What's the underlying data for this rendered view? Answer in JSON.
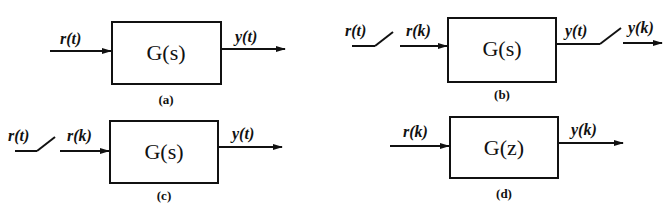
{
  "diagram": {
    "panels": [
      {
        "id": "a",
        "caption": "(a)",
        "block": {
          "func": "G",
          "var": "s"
        },
        "input_signals": [
          "r(t)"
        ],
        "output_signals": [
          "y(t)"
        ],
        "samplers": []
      },
      {
        "id": "b",
        "caption": "(b)",
        "block": {
          "func": "G",
          "var": "s"
        },
        "input_signals": [
          "r(t)",
          "r(k)"
        ],
        "output_signals": [
          "y(t)",
          "y(k)"
        ],
        "samplers": [
          "input-sampler",
          "output-sampler"
        ]
      },
      {
        "id": "c",
        "caption": "(c)",
        "block": {
          "func": "G",
          "var": "s"
        },
        "input_signals": [
          "r(t)",
          "r(k)"
        ],
        "output_signals": [
          "y(t)"
        ],
        "samplers": [
          "input-sampler"
        ]
      },
      {
        "id": "d",
        "caption": "(d)",
        "block": {
          "func": "G",
          "var": "z"
        },
        "input_signals": [
          "r(k)"
        ],
        "output_signals": [
          "y(k)"
        ],
        "samplers": []
      }
    ]
  },
  "labels": {
    "a": {
      "in": "r(t)",
      "out": "y(t)",
      "block": "G(s)",
      "caption": "(a)"
    },
    "b": {
      "in_cont": "r(t)",
      "in_disc": "r(k)",
      "out_cont": "y(t)",
      "out_disc": "y(k)",
      "block": "G(s)",
      "caption": "(b)"
    },
    "c": {
      "in_cont": "r(t)",
      "in_disc": "r(k)",
      "out": "y(t)",
      "block": "G(s)",
      "caption": "(c)"
    },
    "d": {
      "in": "r(k)",
      "out": "y(k)",
      "block": "G(z)",
      "caption": "(d)"
    }
  }
}
